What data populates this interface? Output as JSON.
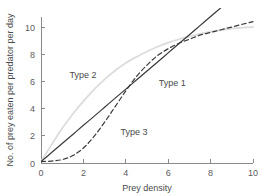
{
  "chart_data": {
    "type": "line",
    "title": "",
    "xlabel": "Prey density",
    "ylabel": "No. of prey eaten per predator per day",
    "xlim": [
      0,
      10
    ],
    "ylim": [
      0,
      11.2
    ],
    "xticks": [
      0,
      2,
      4,
      6,
      8,
      10
    ],
    "yticks": [
      0,
      2,
      4,
      6,
      8,
      10
    ],
    "xtick_labels": [
      "0",
      "2",
      "4",
      "6",
      "8",
      "10"
    ],
    "ytick_labels": [
      "0",
      "2",
      "4",
      "6",
      "8",
      "10"
    ],
    "grid": false,
    "legend": "inline-annotations",
    "series": [
      {
        "name": "Type 1",
        "label": "Type 1",
        "style": "solid",
        "color": "#3a3a3a",
        "x": [
          0,
          0.5,
          1,
          1.5,
          2,
          2.5,
          3,
          3.5,
          4,
          4.5,
          5,
          5.5,
          6,
          6.5,
          7,
          7.5,
          8,
          8.5,
          9
        ],
        "values": [
          0.1,
          0.77,
          1.43,
          2.1,
          2.77,
          3.43,
          4.1,
          4.77,
          5.43,
          6.1,
          6.77,
          7.43,
          8.1,
          8.77,
          9.43,
          10.1,
          10.77,
          11.43,
          12.1
        ]
      },
      {
        "name": "Type 2",
        "label": "Type 2",
        "style": "solid",
        "color": "#dcdcdc",
        "x": [
          0,
          0.5,
          1,
          1.5,
          2,
          2.5,
          3,
          3.5,
          4,
          4.5,
          5,
          5.5,
          6,
          6.5,
          7,
          7.5,
          8,
          8.5,
          9,
          9.5,
          10
        ],
        "values": [
          0.1,
          1.35,
          2.55,
          3.6,
          4.55,
          5.4,
          6.15,
          6.8,
          7.35,
          7.8,
          8.2,
          8.55,
          8.85,
          9.1,
          9.3,
          9.5,
          9.65,
          9.78,
          9.88,
          9.95,
          10.0
        ]
      },
      {
        "name": "Type 3",
        "label": "Type 3",
        "style": "dashed",
        "color": "#3a3a3a",
        "x": [
          0,
          0.5,
          1,
          1.5,
          2,
          2.5,
          3,
          3.5,
          4,
          4.5,
          5,
          5.5,
          6,
          6.5,
          7,
          7.5,
          8,
          8.5,
          9,
          9.5,
          10
        ],
        "values": [
          0.1,
          0.14,
          0.25,
          0.55,
          1.1,
          1.95,
          3.0,
          4.15,
          5.3,
          6.35,
          7.2,
          7.9,
          8.4,
          8.8,
          9.1,
          9.4,
          9.6,
          9.8,
          10.0,
          10.2,
          10.4
        ]
      }
    ],
    "annotations": [
      {
        "text": "Type 1",
        "x": 5.55,
        "y": 5.65
      },
      {
        "text": "Type 2",
        "x": 1.35,
        "y": 6.25
      },
      {
        "text": "Type 3",
        "x": 3.75,
        "y": 2.05
      }
    ]
  }
}
